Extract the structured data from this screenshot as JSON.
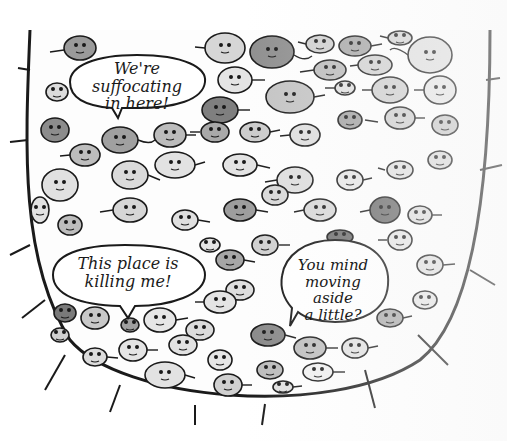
{
  "illustration": {
    "subject": "crowded container of cartoon blob creatures",
    "colors": {
      "ink": "#1a1a1a",
      "blob_light": "#d9d9d9",
      "blob_mid": "#b5b5b5",
      "blob_dark": "#8a8a8a",
      "paper": "#ffffff"
    }
  },
  "speech_bubbles": [
    {
      "id": "top-left",
      "line1": "We're suffocating",
      "line2": "in here!"
    },
    {
      "id": "bottom-left",
      "line1": "This place is",
      "line2": "killing me!"
    },
    {
      "id": "bottom-right",
      "line1": "You mind",
      "line2": "moving aside",
      "line3": "a little?"
    }
  ]
}
